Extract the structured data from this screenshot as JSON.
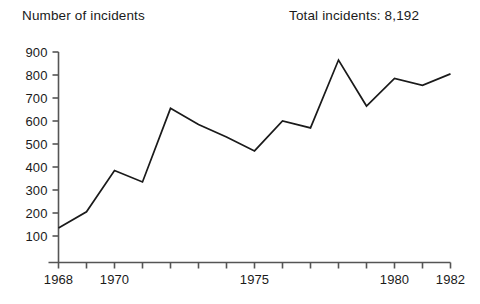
{
  "header": {
    "y_axis_caption": "Number of incidents",
    "total_label": "Total incidents: 8,192"
  },
  "chart_data": {
    "type": "line",
    "title": "",
    "subtitle": "",
    "xlabel": "",
    "ylabel": "Number of incidents",
    "annotations": [
      "Total incidents: 8,192"
    ],
    "grid": false,
    "legend": null,
    "line_color": "#1a1a1a",
    "axis_color": "#555555",
    "xlim": [
      1968,
      1982
    ],
    "ylim": [
      0,
      900
    ],
    "yticks": [
      100,
      200,
      300,
      400,
      500,
      600,
      700,
      800,
      900
    ],
    "ytick_labels": [
      "100",
      "200",
      "300",
      "400",
      "500",
      "600",
      "700",
      "800",
      "900"
    ],
    "xticks": [
      1968,
      1969,
      1970,
      1971,
      1972,
      1973,
      1974,
      1975,
      1976,
      1977,
      1978,
      1979,
      1980,
      1981,
      1982
    ],
    "xtick_labels_shown": [
      "1968",
      "1970",
      "1975",
      "1980",
      "1982"
    ],
    "xtick_labeled_values": [
      1968,
      1970,
      1975,
      1980,
      1982
    ],
    "x": [
      1968,
      1969,
      1970,
      1971,
      1972,
      1973,
      1974,
      1975,
      1976,
      1977,
      1978,
      1979,
      1980,
      1981,
      1982
    ],
    "values": [
      135,
      205,
      385,
      335,
      655,
      585,
      530,
      470,
      600,
      570,
      865,
      665,
      785,
      755,
      805
    ]
  }
}
